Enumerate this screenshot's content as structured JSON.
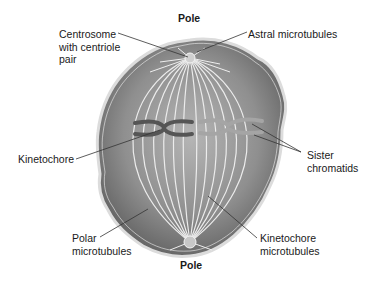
{
  "labels": {
    "pole_top": "Pole",
    "pole_bottom": "Pole",
    "centrosome": "Centrosome\nwith centriole\npair",
    "astral": "Astral microtubules",
    "kinetochore": "Kinetochore",
    "sister_chromatids": "Sister\nchromatids",
    "polar_microtubules": "Polar\nmicrotubules",
    "kinetochore_microtubules": "Kinetochore\nmicrotubules"
  },
  "colors": {
    "cell_fill": "#8a8a8a",
    "cell_edge": "#d8d8d8",
    "fibers": "#e8e8e8",
    "chromatid_dark": "#5a5a5a",
    "chromatid_light": "#a8a8a8",
    "leader_line": "#333333"
  }
}
